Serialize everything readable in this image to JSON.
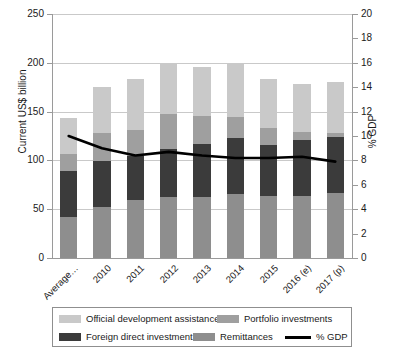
{
  "chart_data": {
    "type": "bar",
    "title": "",
    "subtitle": "",
    "stacked": true,
    "categories": [
      "Average…",
      "2010",
      "2011",
      "2012",
      "2013",
      "2014",
      "2015",
      "2016 (e)",
      "2017 (p)"
    ],
    "series": [
      {
        "name": "Remittances",
        "color": "#8e8e8e",
        "values": [
          42,
          52,
          59,
          63,
          62,
          66,
          64,
          64,
          67
        ]
      },
      {
        "name": "Foreign direct investment",
        "color": "#3b3b3b",
        "values": [
          47,
          47,
          45,
          49,
          55,
          57,
          52,
          57,
          57
        ]
      },
      {
        "name": "Portfolio investments",
        "color": "#9f9f9f",
        "values": [
          18,
          29,
          27,
          36,
          28,
          21,
          17,
          8,
          4
        ]
      },
      {
        "name": "Official development assistance",
        "color": "#c9c9c9",
        "values": [
          36,
          47,
          52,
          52,
          51,
          55,
          50,
          49,
          52
        ]
      }
    ],
    "totals": [
      143,
      175,
      183,
      200,
      196,
      199,
      183,
      178,
      180
    ],
    "line_series": {
      "name": "% GDP",
      "color": "#000000",
      "axis": "right",
      "values": [
        10.0,
        9.0,
        8.4,
        8.7,
        8.4,
        8.2,
        8.2,
        8.3,
        7.9
      ]
    },
    "xlabel": "",
    "ylabel": "Current US$ billion",
    "ylabel_right": "% GDP",
    "ylim": [
      0,
      250
    ],
    "yticks": [
      0,
      50,
      100,
      150,
      200,
      250
    ],
    "ylim_right": [
      0,
      20
    ],
    "yticks_right": [
      0,
      2,
      4,
      6,
      8,
      10,
      12,
      14,
      16,
      18,
      20
    ],
    "grid": true,
    "legend_position": "bottom"
  },
  "legend": {
    "items": [
      {
        "label": "Official development assistance",
        "swatch": "legend-swatch-oda",
        "color": "#c9c9c9",
        "kind": "box"
      },
      {
        "label": "Portfolio investments",
        "swatch": "legend-swatch-portfolio",
        "color": "#9f9f9f",
        "kind": "box"
      },
      {
        "label": "Foreign direct investment",
        "swatch": "legend-swatch-fdi",
        "color": "#3b3b3b",
        "kind": "box"
      },
      {
        "label": "Remittances",
        "swatch": "legend-swatch-remittances",
        "color": "#8e8e8e",
        "kind": "box"
      },
      {
        "label": "% GDP",
        "swatch": "legend-swatch-gdp",
        "color": "#000000",
        "kind": "line"
      }
    ]
  }
}
